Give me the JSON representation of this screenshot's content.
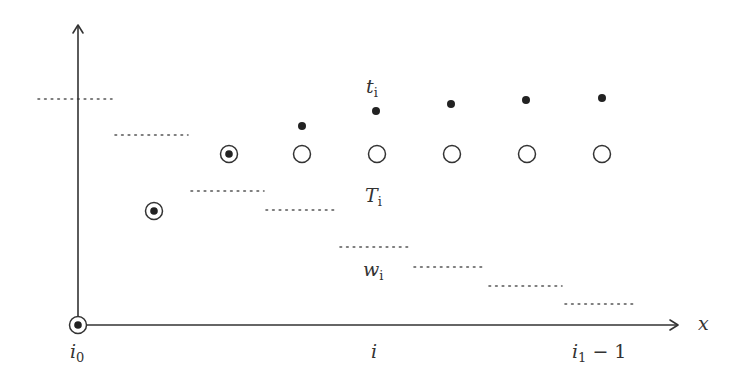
{
  "diagram": {
    "axes": {
      "origin": [
        78,
        325
      ],
      "y_axis_top": 25,
      "x_axis_right": 678,
      "x_label": "x"
    },
    "tick_labels": [
      {
        "id": "i0",
        "main": "i",
        "sub": "0",
        "suffix": "",
        "x": 70,
        "y": 358
      },
      {
        "id": "i",
        "main": "i",
        "sub": "",
        "suffix": "",
        "x": 371,
        "y": 358
      },
      {
        "id": "i1-minus-1",
        "main": "i",
        "sub": "1",
        "suffix": " − 1",
        "x": 572,
        "y": 358
      }
    ],
    "series_labels": {
      "t": {
        "main": "t",
        "sub": "i",
        "x": 366,
        "y": 93
      },
      "T": {
        "main": "T",
        "sub": "i",
        "x": 365,
        "y": 202
      },
      "w": {
        "main": "w",
        "sub": "i",
        "x": 363,
        "y": 276
      }
    },
    "marked_points": [
      {
        "x": 78,
        "y": 325,
        "type": "circle-dot"
      },
      {
        "x": 154,
        "y": 211,
        "type": "circle-dot"
      },
      {
        "x": 229,
        "y": 154,
        "type": "circle-dot"
      }
    ],
    "open_circles": [
      {
        "x": 302,
        "y": 154
      },
      {
        "x": 377,
        "y": 154
      },
      {
        "x": 452,
        "y": 154
      },
      {
        "x": 527,
        "y": 154
      },
      {
        "x": 602,
        "y": 154
      }
    ],
    "t_points": [
      {
        "x": 302,
        "y": 126
      },
      {
        "x": 376,
        "y": 111
      },
      {
        "x": 451,
        "y": 104
      },
      {
        "x": 526,
        "y": 100
      },
      {
        "x": 602,
        "y": 98
      }
    ],
    "w_segments": [
      {
        "x1": 38,
        "x2": 112,
        "y": 99
      },
      {
        "x1": 115,
        "x2": 188,
        "y": 135
      },
      {
        "x1": 191,
        "x2": 264,
        "y": 191
      },
      {
        "x1": 266,
        "x2": 337,
        "y": 210
      },
      {
        "x1": 340,
        "x2": 411,
        "y": 247
      },
      {
        "x1": 414,
        "x2": 486,
        "y": 267
      },
      {
        "x1": 489,
        "x2": 562,
        "y": 286
      },
      {
        "x1": 565,
        "x2": 637,
        "y": 304
      }
    ],
    "colors": {
      "stroke": "#333333",
      "dotted": "#555555",
      "background": "#ffffff"
    }
  }
}
